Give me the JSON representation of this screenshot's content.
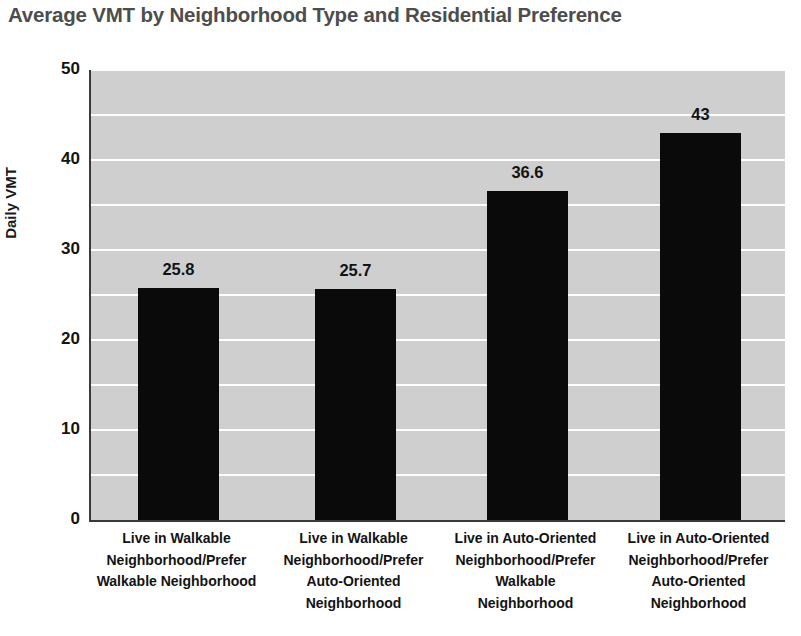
{
  "chart_data": {
    "type": "bar",
    "title": "Average VMT by Neighborhood Type and Residential Preference",
    "xlabel": "",
    "ylabel": "Daily VMT",
    "ylim": [
      0,
      50
    ],
    "y_ticks": [
      0,
      10,
      20,
      30,
      40,
      50
    ],
    "gridlines": [
      0,
      5,
      10,
      15,
      20,
      25,
      30,
      35,
      40,
      45,
      50
    ],
    "grid": true,
    "legend": "none",
    "bar_color": "#0a0a0a",
    "plot_background": "#cfcfcf",
    "gridline_color": "#ffffff",
    "title_color": "#4d4d4d",
    "categories": [
      "Live in Walkable Neighborhood/Prefer Walkable Neighborhood",
      "Live in Walkable Neighborhood/Prefer Auto-Oriented Neighborhood",
      "Live in Auto-Oriented Neighborhood/Prefer Walkable Neighborhood",
      "Live in Auto-Oriented Neighborhood/Prefer Auto-Oriented Neighborhood"
    ],
    "category_lines": [
      [
        "Live in Walkable",
        "Neighborhood/Prefer",
        "Walkable Neighborhood"
      ],
      [
        "Live in Walkable",
        "Neighborhood/Prefer",
        "Auto-Oriented",
        "Neighborhood"
      ],
      [
        "Live in Auto-Oriented",
        "Neighborhood/Prefer",
        "Walkable",
        "Neighborhood"
      ],
      [
        "Live in Auto-Oriented",
        "Neighborhood/Prefer",
        "Auto-Oriented",
        "Neighborhood"
      ]
    ],
    "values": [
      25.8,
      25.7,
      36.6,
      43
    ],
    "value_labels": [
      "25.8",
      "25.7",
      "36.6",
      "43"
    ]
  }
}
